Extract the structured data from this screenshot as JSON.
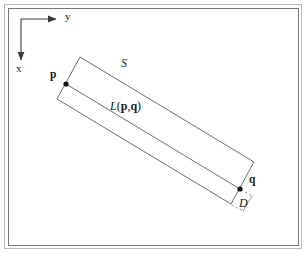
{
  "figure": {
    "caption_domain": "geometry-diagram",
    "background_color": "#ffffff",
    "stroke_color": "#4d4d4d",
    "frame_color": "#7a7a7a",
    "text_color": "#1a1a1a"
  },
  "frame": {
    "outer": {
      "x": 4,
      "y": 4,
      "width": 298,
      "height": 245
    },
    "inner": {
      "x": 8,
      "y": 8,
      "width": 291,
      "height": 238
    }
  },
  "axes": {
    "origin": {
      "x": 21,
      "y": 19
    },
    "y_axis": {
      "label": "y",
      "label_x": 66,
      "label_y": 17,
      "from": {
        "x": 21,
        "y": 19
      },
      "to": {
        "x": 56,
        "y": 19
      },
      "arrow": "right"
    },
    "x_axis": {
      "label": "x",
      "label_x": 17,
      "label_y": 69,
      "from": {
        "x": 21,
        "y": 19
      },
      "to": {
        "x": 21,
        "y": 60
      },
      "arrow": "down"
    }
  },
  "strip": {
    "name": "S",
    "label": "S",
    "label_x": 122,
    "label_y": 64,
    "corners": {
      "top_left": {
        "x": 80,
        "y": 57
      },
      "top_right": {
        "x": 254,
        "y": 162
      },
      "bottom_right": {
        "x": 231,
        "y": 204
      },
      "bottom_left": {
        "x": 57,
        "y": 99
      }
    }
  },
  "line": {
    "name": "L(p,q)",
    "label_italic": "L",
    "label_paren_open": "(",
    "label_p": "p",
    "label_comma": ",",
    "label_q": "q",
    "label_paren_close": ")",
    "label_x": 111,
    "label_y": 107,
    "from": {
      "x": 66,
      "y": 84
    },
    "to": {
      "x": 240,
      "y": 189
    }
  },
  "points": [
    {
      "name": "p",
      "label": "p",
      "marker_x": 66,
      "marker_y": 84,
      "marker_radius": 2.6,
      "label_x": 51,
      "label_y": 76
    },
    {
      "name": "q",
      "label": "q",
      "marker_x": 240,
      "marker_y": 189,
      "marker_radius": 2.6,
      "label_x": 248,
      "label_y": 181
    }
  ],
  "dimension": {
    "label": "D",
    "label_x": 241,
    "label_y": 204,
    "leader_from": {
      "x": 240,
      "y": 189
    },
    "leader_to": {
      "x": 231,
      "y": 204
    },
    "offset_from": {
      "x": 252,
      "y": 196
    },
    "offset_to": {
      "x": 243,
      "y": 211
    },
    "tick_top_from": {
      "x": 241,
      "y": 190
    },
    "tick_top_to": {
      "x": 253,
      "y": 196
    },
    "tick_bottom_from": {
      "x": 232,
      "y": 205
    },
    "tick_bottom_to": {
      "x": 244,
      "y": 211
    }
  }
}
